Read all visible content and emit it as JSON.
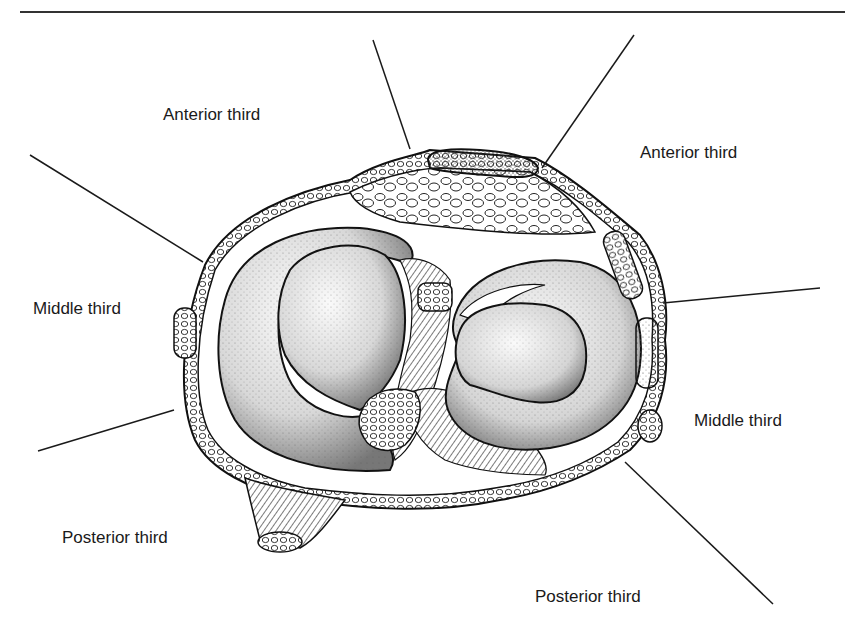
{
  "header": {
    "running_head_fragment": "",
    "rule": true
  },
  "figure": {
    "labels": [
      {
        "id": "anterior-left",
        "text": "Anterior third",
        "x": 163,
        "y": 105
      },
      {
        "id": "anterior-right",
        "text": "Anterior third",
        "x": 640,
        "y": 143
      },
      {
        "id": "middle-left",
        "text": "Middle third",
        "x": 33,
        "y": 299
      },
      {
        "id": "middle-right",
        "text": "Middle third",
        "x": 694,
        "y": 411
      },
      {
        "id": "posterior-left",
        "text": "Posterior third",
        "x": 62,
        "y": 528
      },
      {
        "id": "posterior-right",
        "text": "Posterior third",
        "x": 535,
        "y": 587
      }
    ],
    "leader_lines": [
      {
        "id": "line-anterior-left",
        "x1": 373,
        "y1": 40,
        "x2": 410,
        "y2": 149
      },
      {
        "id": "line-anterior-right",
        "x1": 634,
        "y1": 35,
        "x2": 542,
        "y2": 168
      },
      {
        "id": "line-middle-left-top",
        "x1": 30,
        "y1": 155,
        "x2": 203,
        "y2": 262
      },
      {
        "id": "line-middle-right-top",
        "x1": 663,
        "y1": 303,
        "x2": 820,
        "y2": 288
      },
      {
        "id": "line-middle-left-bottom",
        "x1": 38,
        "y1": 451,
        "x2": 174,
        "y2": 410
      },
      {
        "id": "line-posterior-right",
        "x1": 625,
        "y1": 462,
        "x2": 773,
        "y2": 604
      }
    ],
    "colors": {
      "ink": "#1a1a1a",
      "stipple": "#555555",
      "paper": "#ffffff"
    }
  }
}
